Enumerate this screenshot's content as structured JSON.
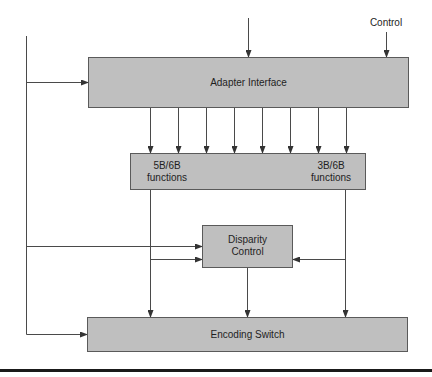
{
  "diagram": {
    "labels": {
      "control": "Control"
    },
    "boxes": {
      "adapter": {
        "label": "Adapter Interface"
      },
      "functions": {
        "left_line1": "5B/6B",
        "left_line2": "functions",
        "right_line1": "3B/6B",
        "right_line2": "functions"
      },
      "disparity": {
        "line1": "Disparity",
        "line2": "Control"
      },
      "encoding": {
        "label": "Encoding Switch"
      }
    },
    "colors": {
      "box_fill": "#bfbfbf",
      "box_border": "#5a5a5a",
      "line": "#4a4a4a",
      "rule": "#1a1a1a"
    },
    "connections": [
      {
        "from": "top-input",
        "to": "adapter"
      },
      {
        "from": "control",
        "to": "adapter"
      },
      {
        "from": "left-bus",
        "to": "adapter"
      },
      {
        "from": "adapter",
        "to": "functions",
        "count": 8
      },
      {
        "from": "left-bus",
        "to": "disparity"
      },
      {
        "from": "5B/6B",
        "to": "disparity"
      },
      {
        "from": "3B/6B",
        "to": "disparity"
      },
      {
        "from": "5B/6B",
        "to": "encoding"
      },
      {
        "from": "disparity",
        "to": "encoding"
      },
      {
        "from": "3B/6B",
        "to": "encoding"
      },
      {
        "from": "left-bus",
        "to": "encoding"
      }
    ]
  }
}
